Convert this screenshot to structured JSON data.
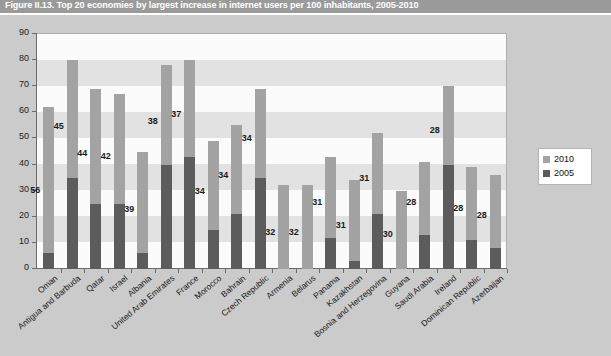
{
  "figure": {
    "title": "Figure II.13.  Top 20 economies by largest increase in internet users per 100 inhabitants, 2005-2010"
  },
  "legend": {
    "position": "right",
    "items": [
      {
        "label": "2010",
        "color": "#a3a3a3"
      },
      {
        "label": "2005",
        "color": "#5c5c5c"
      }
    ]
  },
  "axis": {
    "y_ticks": [
      "0",
      "10",
      "20",
      "30",
      "40",
      "50",
      "60",
      "70",
      "80",
      "90"
    ]
  },
  "chart_data": {
    "type": "bar",
    "subtype": "stacked",
    "title": "Figure II.13.  Top 20 economies by largest increase in internet users per 100 inhabitants, 2005-2010",
    "xlabel": "",
    "ylabel": "",
    "ylim": [
      0,
      90
    ],
    "ytick_step": 10,
    "grid": "horizontal-bands",
    "legend_position": "right",
    "categories": [
      "Oman",
      "Antigua and Barbuda",
      "Qatar",
      "Israel",
      "Albania",
      "United Arab Emirates",
      "France",
      "Morocco",
      "Bahrain",
      "Czech Republic",
      "Armenia",
      "Belarus",
      "Panama",
      "Kazakhstan",
      "Bosnia and Herzegovina",
      "Guyana",
      "Saudi Arabia",
      "Ireland",
      "Dominican Republic",
      "Azerbaijan"
    ],
    "series": [
      {
        "name": "2005",
        "color": "#5c5c5c",
        "values": [
          6,
          35,
          25,
          25,
          6,
          40,
          43,
          15,
          21,
          35,
          0,
          0,
          12,
          3,
          21,
          0,
          13,
          40,
          11,
          8
        ]
      },
      {
        "name": "2010",
        "color": "#a3a3a3",
        "note": "increment above 2005 (stacked); data labels show this increase",
        "values": [
          56,
          45,
          44,
          42,
          39,
          38,
          37,
          34,
          34,
          34,
          32,
          32,
          31,
          31,
          31,
          30,
          28,
          28,
          28,
          28
        ]
      }
    ],
    "totals": [
      62,
      80,
      69,
      67,
      45,
      78,
      80,
      49,
      55,
      69,
      32,
      32,
      43,
      34,
      52,
      30,
      41,
      70,
      39,
      36
    ],
    "data_labels": [
      56,
      45,
      44,
      42,
      39,
      38,
      37,
      34,
      34,
      34,
      32,
      32,
      31,
      31,
      31,
      30,
      28,
      28,
      28,
      28
    ]
  }
}
